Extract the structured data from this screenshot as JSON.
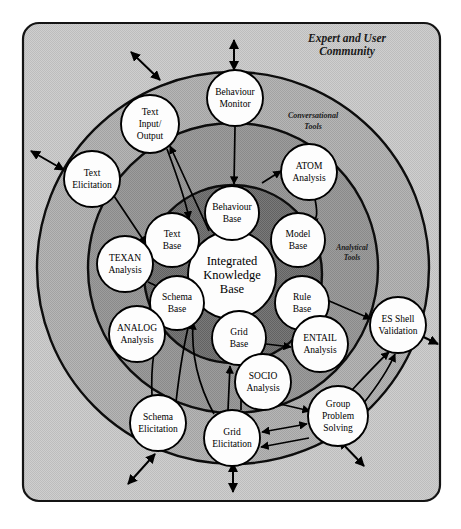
{
  "figure": {
    "title_visible": false,
    "frame": {
      "name": "outer-frame",
      "fill": "#c8c8c8",
      "stroke": "#111111"
    },
    "zones": [
      {
        "id": "community",
        "label": "Expert and User\nCommunity",
        "label_lines": [
          "Expert and User",
          "Community"
        ],
        "fill": "#c8c8c8",
        "font_size": 11.5
      },
      {
        "id": "conversational",
        "label": "Conversational\nTools",
        "label_lines": [
          "Conversational",
          "Tools"
        ],
        "fill": "#b0b0b0",
        "font_size": 8
      },
      {
        "id": "analytical",
        "label": "Analytical\nTools",
        "label_lines": [
          "Analytical",
          "Tools"
        ],
        "fill": "#9a9a9a",
        "font_size": 7.5
      },
      {
        "id": "knowledge-core",
        "label": "",
        "label_lines": [],
        "fill": "#6e6e6e",
        "font_size": 0
      }
    ],
    "nodes": [
      {
        "id": "integrated-knowledge-base",
        "lines": [
          "Integrated",
          "Knowledge",
          "Base"
        ],
        "cx": 232,
        "cy": 275,
        "r": 44,
        "font_size": 12.5,
        "ring": "core"
      },
      {
        "id": "behaviour-base",
        "lines": [
          "Behaviour",
          "Base"
        ],
        "cx": 232,
        "cy": 213,
        "r": 27,
        "font_size": 9.5,
        "ring": "core"
      },
      {
        "id": "model-base",
        "lines": [
          "Model",
          "Base"
        ],
        "cx": 298,
        "cy": 240,
        "r": 27,
        "font_size": 9.5,
        "ring": "core"
      },
      {
        "id": "rule-base",
        "lines": [
          "Rule",
          "Base"
        ],
        "cx": 302,
        "cy": 303,
        "r": 27,
        "font_size": 9.5,
        "ring": "core"
      },
      {
        "id": "grid-base",
        "lines": [
          "Grid",
          "Base"
        ],
        "cx": 239,
        "cy": 338,
        "r": 27,
        "font_size": 9.5,
        "ring": "core"
      },
      {
        "id": "schema-base",
        "lines": [
          "Schema",
          "Base"
        ],
        "cx": 177,
        "cy": 303,
        "r": 27,
        "font_size": 9.5,
        "ring": "core"
      },
      {
        "id": "text-base",
        "lines": [
          "Text",
          "Base"
        ],
        "cx": 172,
        "cy": 240,
        "r": 27,
        "font_size": 9.5,
        "ring": "core"
      },
      {
        "id": "atom-analysis",
        "lines": [
          "ATOM",
          "Analysis"
        ],
        "cx": 309,
        "cy": 172,
        "r": 28,
        "font_size": 9.5,
        "ring": "analytical"
      },
      {
        "id": "entail-analysis",
        "lines": [
          "ENTAIL",
          "Analysis"
        ],
        "cx": 320,
        "cy": 344,
        "r": 28,
        "font_size": 9.5,
        "ring": "analytical"
      },
      {
        "id": "socio-analysis",
        "lines": [
          "SOCIO",
          "Analysis"
        ],
        "cx": 263,
        "cy": 382,
        "r": 28,
        "font_size": 9.5,
        "ring": "analytical"
      },
      {
        "id": "texan-analysis",
        "lines": [
          "TEXAN",
          "Analysis"
        ],
        "cx": 125,
        "cy": 264,
        "r": 28,
        "font_size": 9.5,
        "ring": "analytical"
      },
      {
        "id": "analog-analysis",
        "lines": [
          "ANALOG",
          "Analysis"
        ],
        "cx": 137,
        "cy": 334,
        "r": 28,
        "font_size": 9.5,
        "ring": "analytical"
      },
      {
        "id": "behaviour-monitor",
        "lines": [
          "Behaviour",
          "Monitor"
        ],
        "cx": 235,
        "cy": 98,
        "r": 28,
        "font_size": 9.5,
        "ring": "conversational"
      },
      {
        "id": "text-input-output",
        "lines": [
          "Text",
          "Input/",
          "Output"
        ],
        "cx": 150,
        "cy": 124,
        "r": 29,
        "font_size": 9.5,
        "ring": "conversational"
      },
      {
        "id": "text-elicitation",
        "lines": [
          "Text",
          "Elicitation"
        ],
        "cx": 92,
        "cy": 179,
        "r": 28,
        "font_size": 9.5,
        "ring": "community"
      },
      {
        "id": "es-shell-validation",
        "lines": [
          "ES Shell",
          "Validation"
        ],
        "cx": 398,
        "cy": 325,
        "r": 28,
        "font_size": 9.5,
        "ring": "community"
      },
      {
        "id": "group-problem-solving",
        "lines": [
          "Group",
          "Problem",
          "Solving"
        ],
        "cx": 338,
        "cy": 416,
        "r": 30,
        "font_size": 9.5,
        "ring": "conversational"
      },
      {
        "id": "grid-elicitation",
        "lines": [
          "Grid",
          "Elicitation"
        ],
        "cx": 232,
        "cy": 438,
        "r": 28,
        "font_size": 9.5,
        "ring": "conversational"
      },
      {
        "id": "schema-elicitation",
        "lines": [
          "Schema",
          "Elicitation"
        ],
        "cx": 158,
        "cy": 423,
        "r": 28,
        "font_size": 9.5,
        "ring": "conversational"
      }
    ],
    "edges": [
      {
        "from": "behaviour-monitor",
        "to": "behaviour-base",
        "arrow": "single"
      },
      {
        "from": "atom-analysis",
        "to": "model-base",
        "arrow": "single"
      },
      {
        "from": "text-input-output",
        "to": "text-base",
        "arrow": "single"
      },
      {
        "from": "text-elicitation",
        "to": "texan-analysis",
        "arrow": "single"
      },
      {
        "from": "texan-analysis",
        "to": "text-base",
        "arrow": "single"
      },
      {
        "from": "analog-analysis",
        "to": "schema-base",
        "arrow": "single"
      },
      {
        "from": "schema-elicitation",
        "to": "schema-base",
        "arrow": "single"
      },
      {
        "from": "grid-elicitation",
        "to": "grid-base",
        "arrow": "single"
      },
      {
        "from": "socio-analysis",
        "to": "grid-base",
        "arrow": "single"
      },
      {
        "from": "entail-analysis",
        "to": "rule-base",
        "arrow": "single"
      },
      {
        "from": "rule-base",
        "to": "es-shell-validation",
        "arrow": "single"
      },
      {
        "from": "group-problem-solving",
        "to": "es-shell-validation",
        "arrow": "single"
      },
      {
        "from": "group-problem-solving",
        "to": "grid-elicitation",
        "arrow": "double"
      },
      {
        "from": "socio-analysis",
        "to": "group-problem-solving",
        "arrow": "single"
      },
      {
        "from": "grid-base",
        "to": "entail-analysis",
        "arrow": "single"
      }
    ],
    "external_arrows": [
      {
        "id": "arrow-top",
        "label": ""
      },
      {
        "id": "arrow-upper-left",
        "label": ""
      },
      {
        "id": "arrow-left",
        "label": ""
      },
      {
        "id": "arrow-bottom-left",
        "label": ""
      },
      {
        "id": "arrow-bottom",
        "label": ""
      },
      {
        "id": "arrow-bottom-right",
        "label": ""
      },
      {
        "id": "arrow-right",
        "label": ""
      }
    ]
  }
}
